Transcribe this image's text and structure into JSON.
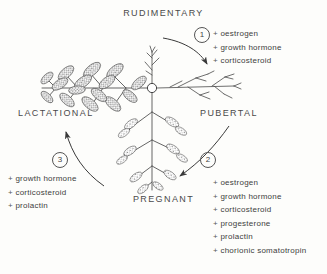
{
  "diagram": {
    "title_stage": "RUDIMENTARY",
    "stages": {
      "rudimentary": "RUDIMENTARY",
      "pubertal": "PUBERTAL",
      "pregnant": "PREGNANT",
      "lactational": "LACTATIONAL"
    },
    "markers": {
      "one": "1",
      "two": "2",
      "three": "3"
    },
    "transitions": [
      {
        "marker": "1",
        "from": "RUDIMENTARY",
        "to": "PUBERTAL",
        "hormones": [
          "oestrogen",
          "growth hormone",
          "corticosteroid"
        ]
      },
      {
        "marker": "2",
        "from": "PUBERTAL",
        "to": "PREGNANT",
        "hormones": [
          "oestrogen",
          "growth hormone",
          "corticosteroid",
          "progesterone",
          "prolactin",
          "chorionic somatotropin"
        ]
      },
      {
        "marker": "3",
        "from": "PREGNANT",
        "to": "LACTATIONAL",
        "hormones": [
          "growth hormone",
          "corticosteroid",
          "prolactin"
        ]
      }
    ],
    "hormone_lists": {
      "top_right": [
        "oestrogen",
        "growth hormone",
        "corticosteroid"
      ],
      "bottom_right": [
        "oestrogen",
        "growth hormone",
        "corticosteroid",
        "progesterone",
        "prolactin",
        "chorionic somatotropin"
      ],
      "bottom_left": [
        "growth hormone",
        "corticosteroid",
        "prolactin"
      ]
    },
    "colors": {
      "ink": "#3a3a3a",
      "line": "#555555",
      "background": "#fdfdfb"
    },
    "hub_label": "nipple-hub"
  }
}
